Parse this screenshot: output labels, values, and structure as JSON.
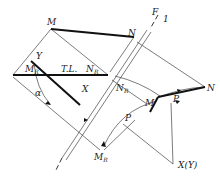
{
  "diagram": {
    "labels": {
      "M_top": "M",
      "N_top": "N",
      "F": "F",
      "one": "1",
      "Y": "Y",
      "M": "M",
      "R": "R",
      "N": "N",
      "TL": "T.L.",
      "X": "X",
      "alpha": "α",
      "P": "P",
      "XY": "X(Y)"
    },
    "colors": {
      "line": "#333333",
      "thick": "#111111"
    }
  }
}
